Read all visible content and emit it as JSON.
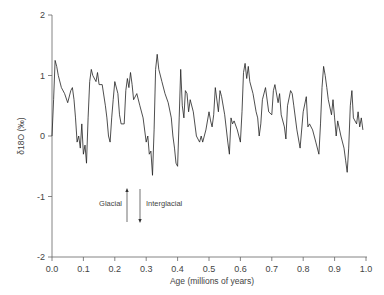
{
  "chart_data": {
    "type": "line",
    "title": "",
    "xlabel": "Age (millions of years)",
    "ylabel": "δ18O (‰)",
    "xlim": [
      0.0,
      1.0
    ],
    "ylim": [
      -2,
      2
    ],
    "grid": false,
    "legend": null,
    "x_ticks": [
      "0.0",
      "0.1",
      "0.2",
      "0.3",
      "0.4",
      "0.5",
      "0.6",
      "0.7",
      "0.8",
      "0.9",
      "1.0"
    ],
    "y_ticks": [
      "2",
      "1",
      "0",
      "-1",
      "-2"
    ],
    "annotations": [
      {
        "text": "Glacial",
        "arrow": "up",
        "x": 0.23,
        "y": -0.8
      },
      {
        "text": "Interglacial",
        "arrow": "down",
        "x": 0.27,
        "y": -0.8
      }
    ],
    "series": [
      {
        "name": "δ18O",
        "x": [
          0.0,
          0.005,
          0.01,
          0.015,
          0.02,
          0.03,
          0.04,
          0.05,
          0.06,
          0.065,
          0.07,
          0.075,
          0.08,
          0.085,
          0.09,
          0.095,
          0.1,
          0.105,
          0.11,
          0.115,
          0.12,
          0.125,
          0.13,
          0.14,
          0.145,
          0.15,
          0.16,
          0.17,
          0.175,
          0.18,
          0.185,
          0.19,
          0.195,
          0.2,
          0.21,
          0.215,
          0.22,
          0.23,
          0.235,
          0.24,
          0.245,
          0.25,
          0.255,
          0.26,
          0.27,
          0.28,
          0.29,
          0.3,
          0.305,
          0.31,
          0.315,
          0.32,
          0.325,
          0.33,
          0.335,
          0.34,
          0.35,
          0.36,
          0.37,
          0.38,
          0.385,
          0.39,
          0.395,
          0.4,
          0.405,
          0.41,
          0.415,
          0.42,
          0.425,
          0.43,
          0.435,
          0.44,
          0.45,
          0.46,
          0.47,
          0.475,
          0.48,
          0.49,
          0.5,
          0.505,
          0.51,
          0.515,
          0.52,
          0.53,
          0.535,
          0.54,
          0.55,
          0.56,
          0.565,
          0.57,
          0.575,
          0.58,
          0.59,
          0.6,
          0.605,
          0.61,
          0.615,
          0.62,
          0.625,
          0.63,
          0.64,
          0.65,
          0.655,
          0.66,
          0.665,
          0.67,
          0.68,
          0.69,
          0.7,
          0.705,
          0.71,
          0.72,
          0.725,
          0.73,
          0.74,
          0.745,
          0.75,
          0.76,
          0.765,
          0.77,
          0.78,
          0.79,
          0.8,
          0.81,
          0.815,
          0.82,
          0.83,
          0.84,
          0.85,
          0.855,
          0.86,
          0.865,
          0.87,
          0.875,
          0.88,
          0.89,
          0.895,
          0.9,
          0.905,
          0.91,
          0.92,
          0.93,
          0.935,
          0.94,
          0.945,
          0.95,
          0.955,
          0.96,
          0.97,
          0.975,
          0.98,
          0.985,
          0.99
        ],
        "values": [
          0.0,
          0.6,
          1.25,
          1.15,
          1.0,
          0.8,
          0.7,
          0.55,
          0.75,
          0.8,
          0.6,
          0.3,
          -0.1,
          0.0,
          -0.2,
          0.2,
          -0.3,
          -0.15,
          -0.45,
          0.3,
          0.9,
          1.1,
          1.0,
          0.9,
          1.05,
          0.85,
          0.85,
          0.5,
          0.3,
          0.0,
          -0.1,
          0.3,
          0.6,
          0.9,
          0.7,
          0.35,
          0.2,
          0.2,
          0.75,
          0.95,
          0.8,
          1.05,
          0.85,
          0.6,
          0.7,
          0.5,
          0.3,
          -0.1,
          0.0,
          -0.3,
          -0.25,
          -0.65,
          0.1,
          1.1,
          1.35,
          1.1,
          0.9,
          0.7,
          0.55,
          0.3,
          0.0,
          -0.2,
          -0.45,
          -0.5,
          0.3,
          1.1,
          0.5,
          0.3,
          0.75,
          0.7,
          0.4,
          0.6,
          0.4,
          0.0,
          -0.1,
          0.0,
          -0.1,
          0.1,
          0.4,
          0.25,
          0.15,
          0.35,
          0.8,
          0.4,
          0.75,
          0.65,
          0.35,
          -0.1,
          -0.3,
          0.3,
          0.2,
          0.25,
          0.1,
          -0.1,
          0.4,
          1.05,
          1.2,
          0.95,
          1.15,
          0.9,
          0.7,
          0.4,
          0.3,
          0.0,
          0.2,
          0.6,
          0.8,
          0.4,
          0.35,
          0.75,
          0.85,
          0.55,
          0.7,
          0.35,
          0.15,
          -0.05,
          0.5,
          0.75,
          0.7,
          0.5,
          0.1,
          -0.2,
          0.4,
          0.65,
          0.15,
          0.2,
          0.1,
          -0.1,
          -0.3,
          0.2,
          0.8,
          1.15,
          1.0,
          0.8,
          0.6,
          0.35,
          0.6,
          0.3,
          0.0,
          0.25,
          0.0,
          -0.2,
          -0.4,
          -0.6,
          -0.2,
          0.5,
          0.75,
          0.3,
          0.2,
          0.4,
          0.15,
          0.3,
          0.1
        ]
      }
    ]
  }
}
